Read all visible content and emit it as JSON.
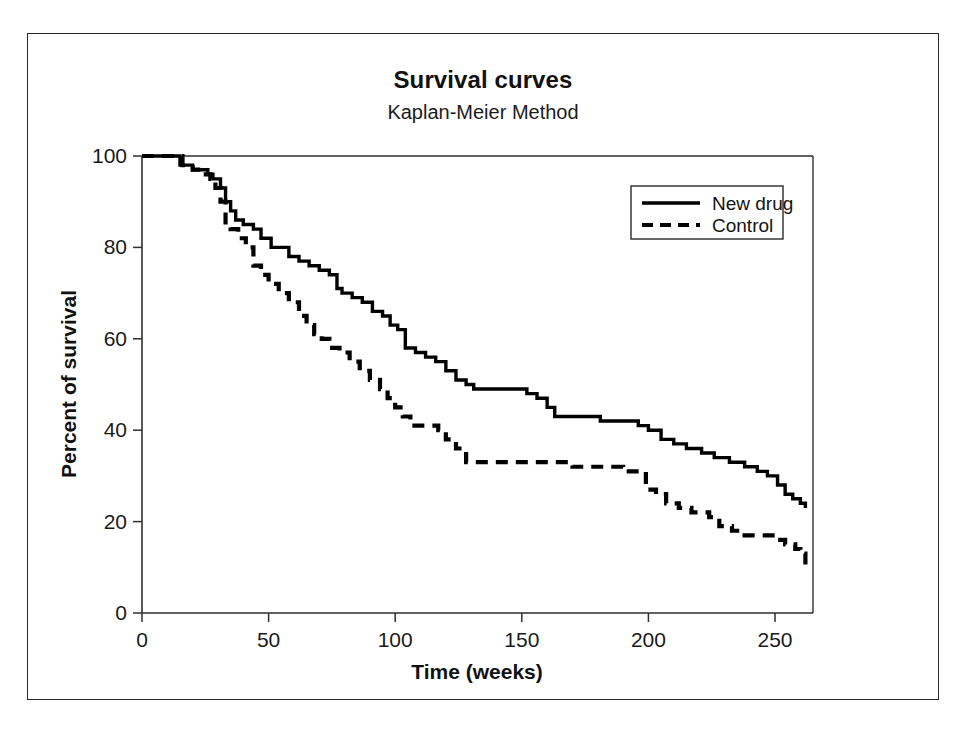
{
  "figure": {
    "title": "Survival curves",
    "subtitle": "Kaplan-Meier Method"
  },
  "chart_data": {
    "type": "line",
    "title": "Survival curves",
    "subtitle": "Kaplan-Meier Method",
    "xlabel": "Time (weeks)",
    "ylabel": "Percent of survival",
    "xlim": [
      0,
      265
    ],
    "ylim": [
      0,
      100
    ],
    "xticks": [
      0,
      50,
      100,
      150,
      200,
      250
    ],
    "xtick_labels": [
      "0",
      "50",
      "100",
      "150",
      "200",
      "250"
    ],
    "yticks": [
      0,
      20,
      40,
      60,
      80,
      100
    ],
    "ytick_labels": [
      "0",
      "20",
      "40",
      "60",
      "80",
      "100"
    ],
    "grid": false,
    "step_type": "post",
    "legend_position": "upper-right",
    "series": [
      {
        "name": "New drug",
        "style": "solid",
        "color": "#000000",
        "x": [
          0,
          12,
          15,
          20,
          26,
          28,
          31,
          33,
          35,
          37,
          40,
          44,
          47,
          51,
          54,
          58,
          62,
          66,
          70,
          74,
          77,
          79,
          83,
          87,
          91,
          95,
          98,
          101,
          104,
          108,
          112,
          116,
          120,
          124,
          128,
          131,
          148,
          152,
          156,
          160,
          163,
          172,
          181,
          190,
          196,
          200,
          205,
          210,
          215,
          221,
          226,
          232,
          238,
          243,
          247,
          251,
          254,
          257,
          260,
          262
        ],
        "y": [
          100,
          100,
          98,
          97,
          96,
          95,
          93,
          90,
          88,
          86,
          85,
          84,
          82,
          80,
          80,
          78,
          77,
          76,
          75,
          74,
          71,
          70,
          69,
          68,
          66,
          65,
          63,
          62,
          58,
          57,
          56,
          55,
          53,
          51,
          50,
          49,
          49,
          48,
          47,
          45,
          43,
          43,
          42,
          42,
          41,
          40,
          38,
          37,
          36,
          35,
          34,
          33,
          32,
          31,
          30,
          28,
          26,
          25,
          24,
          23
        ]
      },
      {
        "name": "Control",
        "style": "dashed",
        "color": "#000000",
        "x": [
          0,
          12,
          16,
          20,
          24,
          27,
          29,
          31,
          33,
          35,
          38,
          41,
          44,
          47,
          50,
          54,
          58,
          62,
          65,
          68,
          71,
          74,
          78,
          82,
          86,
          90,
          94,
          97,
          100,
          103,
          106,
          110,
          114,
          117,
          120,
          124,
          128,
          131,
          150,
          162,
          170,
          180,
          190,
          196,
          199,
          203,
          207,
          212,
          217,
          221,
          224,
          228,
          233,
          238,
          244,
          250,
          254,
          258,
          260,
          262
        ],
        "y": [
          100,
          100,
          98,
          97,
          96,
          95,
          93,
          90,
          85,
          84,
          82,
          80,
          76,
          74,
          72,
          70,
          68,
          65,
          63,
          61,
          60,
          58,
          57,
          55,
          53,
          51,
          49,
          47,
          45,
          43,
          41,
          41,
          41,
          40,
          38,
          36,
          33,
          33,
          33,
          33,
          32,
          32,
          31,
          31,
          27,
          26,
          24,
          23,
          22,
          22,
          21,
          19,
          18,
          17,
          17,
          16,
          15,
          14,
          13,
          10
        ]
      }
    ],
    "legend": [
      {
        "label": "New drug",
        "style": "solid"
      },
      {
        "label": "Control",
        "style": "dashed"
      }
    ]
  }
}
